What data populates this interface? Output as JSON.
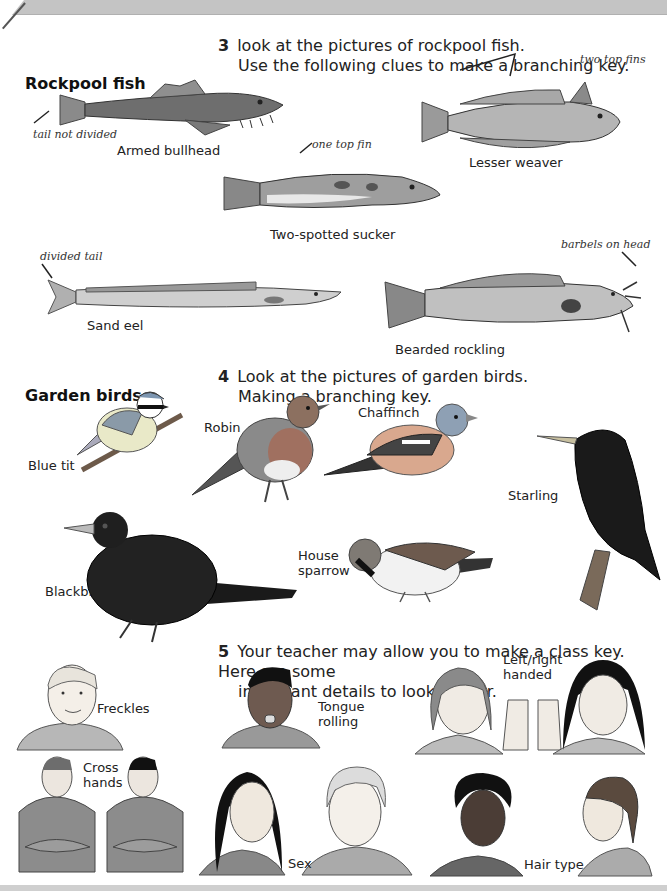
{
  "page": {
    "header_band_color": "#c4c4c4",
    "footer_band_color": "#cfcfcf"
  },
  "section3": {
    "number": "3",
    "line1": "look at the pictures of rockpool fish.",
    "line2": "Use the following clues to make a branching key.",
    "heading": "Rockpool fish",
    "fish": [
      {
        "name": "Armed bullhead",
        "note": "tail not divided"
      },
      {
        "name": "Lesser weaver",
        "note": "two top fins"
      },
      {
        "name": "Two-spotted sucker",
        "note": "one top fin"
      },
      {
        "name": "Sand eel",
        "note": "divided tail"
      },
      {
        "name": "Bearded rockling",
        "note": "barbels on head"
      }
    ]
  },
  "section4": {
    "number": "4",
    "line1": "Look at the pictures of garden birds.",
    "line2": "Making a branching key.",
    "heading": "Garden birds",
    "birds": [
      {
        "name": "Blue tit"
      },
      {
        "name": "Robin"
      },
      {
        "name": "Chaffinch"
      },
      {
        "name": "Starling"
      },
      {
        "name": "Blackbird"
      },
      {
        "name": "House",
        "name2": "sparrow"
      }
    ]
  },
  "section5": {
    "number": "5",
    "line1": "Your teacher may allow you to make a class key. Here are some",
    "line2": "important details to look out for.",
    "traits": [
      {
        "label": "Freckles"
      },
      {
        "label": "Tongue",
        "label2": "rolling"
      },
      {
        "label": "Left/right",
        "label2": "handed"
      },
      {
        "label": "Cross",
        "label2": "hands"
      },
      {
        "label": "Sex"
      },
      {
        "label": "Hair type"
      }
    ]
  }
}
